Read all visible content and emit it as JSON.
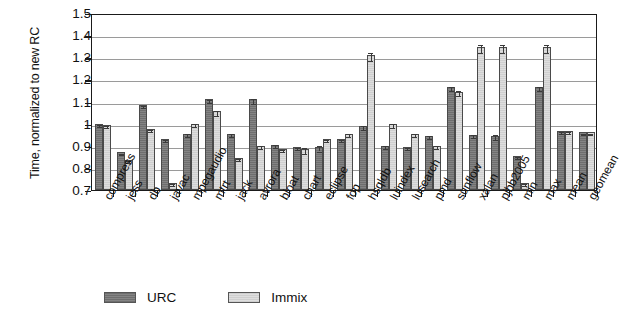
{
  "chart_data": {
    "type": "bar",
    "title": "",
    "subtitle": "",
    "xlabel": "",
    "ylabel": "Time, normalized to new RC",
    "ylim": [
      0.7,
      1.5
    ],
    "yticks": [
      "0.7",
      "0.8",
      "0.9",
      "1",
      "1.1",
      "1.2",
      "1.3",
      "1.4",
      "1.5"
    ],
    "ytick_values": [
      0.7,
      0.8,
      0.9,
      1.0,
      1.1,
      1.2,
      1.3,
      1.4,
      1.5
    ],
    "grid": true,
    "legend_position": "bottom",
    "categories": [
      "compress",
      "jess",
      "db",
      "javac",
      "mpegaudio",
      "mtrt",
      "jack",
      "avrora",
      "bloat",
      "chart",
      "eclipse",
      "fop",
      "hsqldb",
      "luindex",
      "lusearch",
      "pmd",
      "sunflow",
      "xalan",
      "pjbb2005",
      "min",
      "max",
      "mean",
      "geomean"
    ],
    "series": [
      {
        "name": "URC",
        "color": "#7a7a7a",
        "values": [
          1.0,
          0.87,
          1.085,
          0.93,
          0.955,
          1.11,
          0.955,
          1.11,
          0.905,
          0.895,
          0.895,
          0.93,
          0.99,
          0.9,
          0.895,
          0.945,
          1.165,
          0.95,
          0.945,
          0.855,
          1.165,
          0.965,
          0.96
        ],
        "errors": [
          0.004,
          0.004,
          0.004,
          0.004,
          0.006,
          0.006,
          0.006,
          0.012,
          0.006,
          0.006,
          0.012,
          0.006,
          0.009,
          0.006,
          0.006,
          0.006,
          0.009,
          0.006,
          0.012,
          0.004,
          0.009,
          0.004,
          0.004
        ]
      },
      {
        "name": "Immix",
        "color": "#d5d5d5",
        "values": [
          0.995,
          0.835,
          0.975,
          0.73,
          1.0,
          1.055,
          0.845,
          0.9,
          0.885,
          0.885,
          0.93,
          0.955,
          1.31,
          1.0,
          0.955,
          0.9,
          1.145,
          1.345,
          1.345,
          0.73,
          1.345,
          0.965,
          0.96
        ],
        "errors": [
          0.004,
          0.004,
          0.004,
          0.004,
          0.006,
          0.012,
          0.006,
          0.006,
          0.006,
          0.012,
          0.006,
          0.006,
          0.018,
          0.009,
          0.006,
          0.006,
          0.012,
          0.018,
          0.018,
          0.004,
          0.018,
          0.004,
          0.004
        ]
      }
    ]
  },
  "legend": {
    "entries": [
      {
        "label": "URC"
      },
      {
        "label": "Immix"
      }
    ]
  }
}
